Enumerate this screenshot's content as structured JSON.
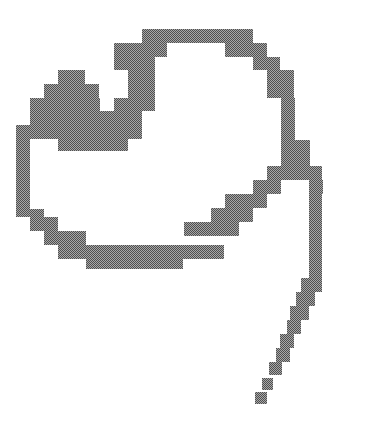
{
  "figure": {
    "fill_dark": "#4f4f4f",
    "fill_light": "#a8a8a8",
    "background": "#ffffff"
  }
}
